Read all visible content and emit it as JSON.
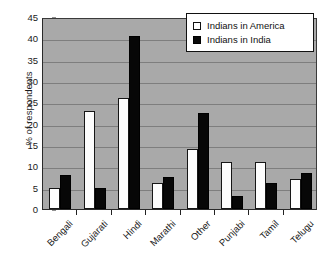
{
  "chart_data": {
    "type": "bar",
    "title": "",
    "xlabel": "",
    "ylabel": "% of respondents",
    "ylim": [
      0,
      45
    ],
    "ytick_step": 5,
    "yticks": [
      0,
      5,
      10,
      15,
      20,
      25,
      30,
      35,
      40,
      45
    ],
    "grid": true,
    "legend_position": "top-right",
    "categories": [
      "Bengali",
      "Gujarati",
      "Hindi",
      "Marathi",
      "Other",
      "Punjabi",
      "Tamil",
      "Telugu"
    ],
    "series": [
      {
        "name": "Indians in America",
        "color": "#ffffff",
        "edge_color": "#111111",
        "values": [
          5,
          23,
          26,
          6,
          14,
          11,
          11,
          7
        ]
      },
      {
        "name": "Indians in India",
        "color": "#0a0a0a",
        "edge_color": "#000000",
        "values": [
          8,
          5,
          40.5,
          7.5,
          22.5,
          3,
          6,
          8.5
        ]
      }
    ],
    "plot_background": "#a9a9a9",
    "gridline_color": "#7e7e7e"
  },
  "legend": {
    "items": [
      {
        "label": "Indians in America",
        "swatch": "open-square-swatch"
      },
      {
        "label": "Indians in India",
        "swatch": "filled-square-swatch"
      }
    ]
  },
  "axes": {
    "y_title": "% of respondents"
  }
}
